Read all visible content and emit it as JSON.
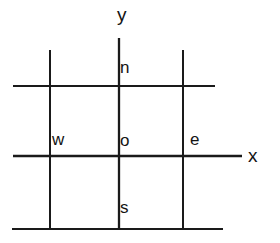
{
  "diagram": {
    "type": "line-diagram",
    "canvas": {
      "width": 280,
      "height": 243,
      "background": "#ffffff"
    },
    "stroke_color": "#1a1a1a",
    "text_color": "#141414",
    "axes": {
      "x": {
        "label": "x",
        "label_position": {
          "x": 248,
          "y": 146
        },
        "line": {
          "x1": 13,
          "y1": 156,
          "x2": 242,
          "y2": 156
        },
        "stroke_width": 2.2
      },
      "y": {
        "label": "y",
        "label_position": {
          "x": 117,
          "y": 5
        },
        "line": {
          "x1": 119,
          "y1": 38,
          "x2": 119,
          "y2": 229
        },
        "stroke_width": 2.2
      }
    },
    "grid_lines": [
      {
        "name": "north-horizontal",
        "orientation": "horizontal",
        "x1": 13,
        "y1": 86,
        "x2": 215,
        "y2": 86,
        "stroke_width": 2.0
      },
      {
        "name": "south-horizontal",
        "orientation": "horizontal",
        "x1": 12,
        "y1": 229,
        "x2": 223,
        "y2": 229,
        "stroke_width": 2.0
      },
      {
        "name": "west-vertical",
        "orientation": "vertical",
        "x1": 50,
        "y1": 50,
        "x2": 50,
        "y2": 229,
        "stroke_width": 2.0
      },
      {
        "name": "east-vertical",
        "orientation": "vertical",
        "x1": 183,
        "y1": 50,
        "x2": 183,
        "y2": 229,
        "stroke_width": 2.0
      }
    ],
    "region_labels": [
      {
        "name": "north",
        "text": "n",
        "x": 120,
        "y": 59
      },
      {
        "name": "west",
        "text": "w",
        "x": 52,
        "y": 131
      },
      {
        "name": "origin",
        "text": "o",
        "x": 120,
        "y": 132
      },
      {
        "name": "east",
        "text": "e",
        "x": 190,
        "y": 131
      },
      {
        "name": "south",
        "text": "s",
        "x": 120,
        "y": 199
      }
    ]
  }
}
